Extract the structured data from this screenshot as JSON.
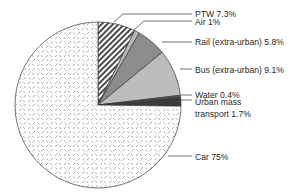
{
  "chart_data": {
    "type": "pie",
    "title": "",
    "start_angle_deg": 0,
    "direction": "clockwise",
    "slices": [
      {
        "label": "PTW",
        "value": 7.3,
        "display": "PTW 7.3%",
        "fill": "hatch-diagonal"
      },
      {
        "label": "Air",
        "value": 1.0,
        "display": "Air 1%",
        "fill": "#b8b8b8"
      },
      {
        "label": "Rail (extra-urban)",
        "value": 5.8,
        "display": "Rail (extra-urban) 5.8%",
        "fill": "#8c8c8c"
      },
      {
        "label": "Bus (extra-urban)",
        "value": 9.1,
        "display": "Bus (extra-urban) 9.1%",
        "fill": "#bdbdbd"
      },
      {
        "label": "Water",
        "value": 0.4,
        "display": "Water 0.4%",
        "fill": "#5a5a5a"
      },
      {
        "label": "Urban mass transport",
        "value": 1.7,
        "display": "Urban mass transport 1.7%",
        "fill": "#3a3a3a"
      },
      {
        "label": "Car",
        "value": 75,
        "display": "Car 75%",
        "fill": "diamond-dash-pattern"
      }
    ]
  },
  "labels": {
    "ptw": "PTW 7.3%",
    "air": "Air 1%",
    "rail": "Rail (extra-urban) 5.8%",
    "bus": "Bus (extra-urban) 9.1%",
    "water": "Water 0.4%",
    "urban_line1": "Urban mass",
    "urban_line2": "transport 1.7%",
    "car": "Car 75%"
  }
}
